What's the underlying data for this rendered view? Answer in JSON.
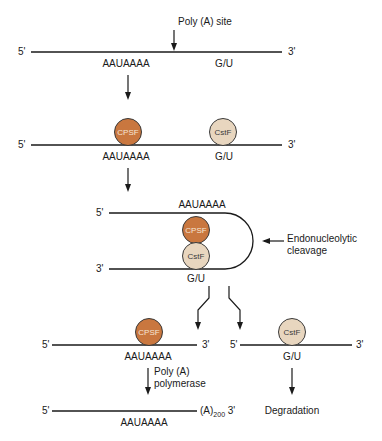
{
  "colors": {
    "cpsf_fill": "#c9773f",
    "cstf_fill": "#e8d6bf",
    "line": "#1a1a1a"
  },
  "step1": {
    "poly_a_site_label": "Poly (A) site",
    "five_prime": "5'",
    "three_prime": "3'",
    "signal": "AAUAAAA",
    "gu_element": "G/U"
  },
  "step2": {
    "five_prime": "5'",
    "three_prime": "3'",
    "signal": "AAUAAAA",
    "gu_element": "G/U",
    "cpsf": "CPSF",
    "cstf": "CstF"
  },
  "step3": {
    "five_prime": "5'",
    "three_prime": "3'",
    "signal": "AAUAAAA",
    "gu_element": "G/U",
    "cpsf": "CPSF",
    "cstf": "CstF",
    "cleavage_label_line1": "Endonucleolytic",
    "cleavage_label_line2": "cleavage"
  },
  "step4_left": {
    "five_prime": "5'",
    "three_prime": "3'",
    "signal": "AAUAAAA",
    "cpsf": "CPSF",
    "enzyme_line1": "Poly (A)",
    "enzyme_line2": "polymerase"
  },
  "step4_right": {
    "five_prime": "5'",
    "three_prime": "3'",
    "gu_element": "G/U",
    "cstf": "CstF",
    "outcome": "Degradation"
  },
  "step5": {
    "five_prime": "5'",
    "three_prime": "3'",
    "signal": "AAUAAAA",
    "tail_base": "(A)",
    "tail_length": "200"
  }
}
